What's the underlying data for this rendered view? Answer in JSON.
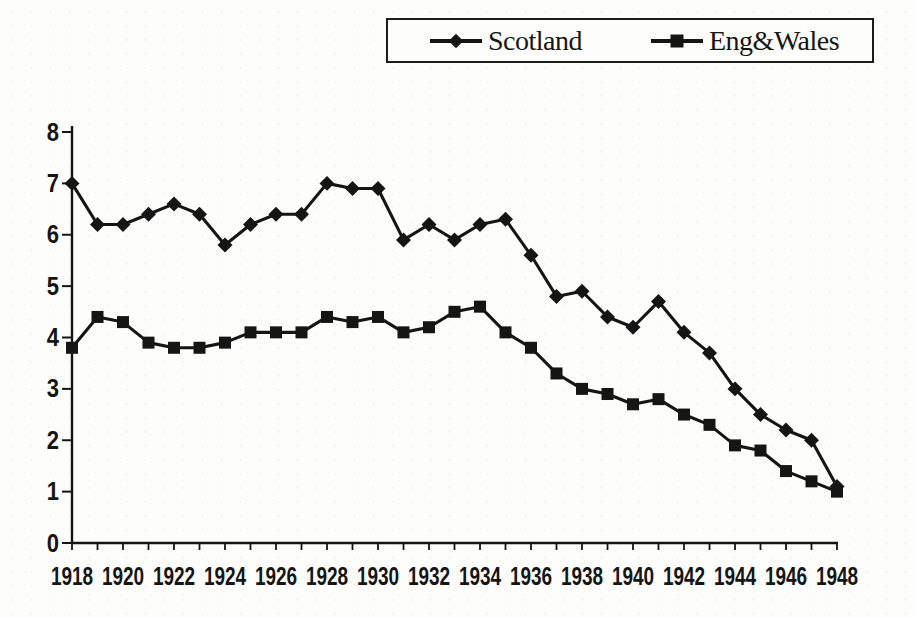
{
  "page": {
    "background_color": "#fdfdfb",
    "ink_color": "#161616"
  },
  "chart_data": {
    "type": "line",
    "title": "",
    "xlabel": "",
    "ylabel": "",
    "grid": false,
    "legend_position": "top",
    "line_color": "#151515",
    "ylim": [
      0,
      8
    ],
    "yticks": [
      0,
      1,
      2,
      3,
      4,
      5,
      6,
      7,
      8
    ],
    "x_years": [
      1918,
      1919,
      1920,
      1921,
      1922,
      1923,
      1924,
      1925,
      1926,
      1927,
      1928,
      1929,
      1930,
      1931,
      1932,
      1933,
      1934,
      1935,
      1936,
      1937,
      1938,
      1939,
      1940,
      1941,
      1942,
      1943,
      1944,
      1945,
      1946,
      1947,
      1948
    ],
    "xtick_labels": [
      "1918",
      "1920",
      "1922",
      "1924",
      "1926",
      "1928",
      "1930",
      "1932",
      "1934",
      "1936",
      "1938",
      "1940",
      "1942",
      "1944",
      "1946",
      "1948"
    ],
    "series": [
      {
        "name": "Scotland",
        "marker": "diamond",
        "values": [
          7.0,
          6.2,
          6.2,
          6.4,
          6.6,
          6.4,
          5.8,
          6.2,
          6.4,
          6.4,
          7.0,
          6.9,
          6.9,
          5.9,
          6.2,
          5.9,
          6.2,
          6.3,
          5.6,
          4.8,
          4.9,
          4.4,
          4.2,
          4.7,
          4.1,
          3.7,
          3.0,
          2.5,
          2.2,
          2.0,
          1.1
        ]
      },
      {
        "name": "Eng&Wales",
        "marker": "square",
        "values": [
          3.8,
          4.4,
          4.3,
          3.9,
          3.8,
          3.8,
          3.9,
          4.1,
          4.1,
          4.1,
          4.4,
          4.3,
          4.4,
          4.1,
          4.2,
          4.5,
          4.6,
          4.1,
          3.8,
          3.3,
          3.0,
          2.9,
          2.7,
          2.8,
          2.5,
          2.3,
          1.9,
          1.8,
          1.4,
          1.2,
          1.0
        ]
      }
    ]
  }
}
